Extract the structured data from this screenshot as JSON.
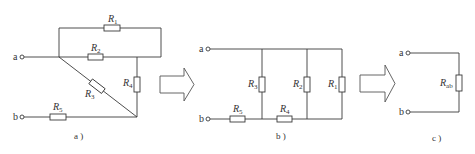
{
  "diagrams": {
    "a": {
      "caption": "a )",
      "terminals": {
        "a": "a",
        "b": "b"
      },
      "resistors": {
        "R1": {
          "letter": "R",
          "sub": "1"
        },
        "R2": {
          "letter": "R",
          "sub": "2"
        },
        "R3": {
          "letter": "R",
          "sub": "3"
        },
        "R4": {
          "letter": "R",
          "sub": "4"
        },
        "R5": {
          "letter": "R",
          "sub": "5"
        }
      }
    },
    "b": {
      "caption": "b )",
      "terminals": {
        "a": "a",
        "b": "b"
      },
      "resistors": {
        "R1": {
          "letter": "R",
          "sub": "1"
        },
        "R2": {
          "letter": "R",
          "sub": "2"
        },
        "R3": {
          "letter": "R",
          "sub": "3"
        },
        "R4": {
          "letter": "R",
          "sub": "4"
        },
        "R5": {
          "letter": "R",
          "sub": "5"
        }
      }
    },
    "c": {
      "caption": "c )",
      "terminals": {
        "a": "a",
        "b": "b"
      },
      "resistors": {
        "Rab": {
          "letter": "R",
          "sub": "ab"
        }
      }
    }
  },
  "arrows": [
    {
      "name": "transform-arrow-1",
      "icon": "right-arrow-icon"
    },
    {
      "name": "transform-arrow-2",
      "icon": "right-arrow-icon"
    }
  ],
  "colors": {
    "line": "#3a3a3a",
    "background": "#ffffff"
  }
}
